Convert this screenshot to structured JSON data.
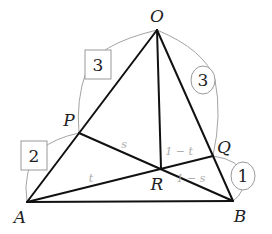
{
  "points": {
    "O": {
      "label": "O"
    },
    "A": {
      "label": "A"
    },
    "B": {
      "label": "B"
    },
    "P": {
      "label": "P"
    },
    "Q": {
      "label": "Q"
    },
    "R": {
      "label": "R"
    }
  },
  "segment_labels": {
    "PR": "s",
    "AR": "t",
    "RO_side": "1 − t",
    "RB_side": "1 − s"
  },
  "ratios": {
    "OP_box": "3",
    "PA_box": "2",
    "OQ_circle": "3",
    "QB_circle": "1"
  }
}
